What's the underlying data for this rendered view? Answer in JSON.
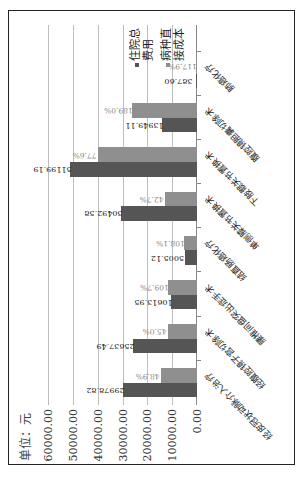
{
  "chart_data": {
    "type": "bar",
    "orientation_in_image": "rotated 90 degrees counter-clockwise",
    "unit_label": "单位：元",
    "ylim": [
      0,
      60000
    ],
    "yticks": [
      "60000.00",
      "50000.00",
      "40000.00",
      "30000.00",
      "20000.00",
      "10000.00",
      "0.00"
    ],
    "grid": true,
    "legend_position": "right",
    "categories": [
      "经皮冠状动脉介入治疗",
      "经腹腔镜子宫切除术",
      "腰椎间盘突出症手术",
      "结直肠癌化疗",
      "单侧膝关节置换术",
      "下肢髋关节置换术",
      "腹腔镜胆囊切除术",
      "肺癌化疗"
    ],
    "series": [
      {
        "name": "住院总费用",
        "color": "#555555",
        "values": [
          29978.82,
          25637.49,
          10613.95,
          5005.12,
          30492.58,
          51199.19,
          13949.11,
          387.6
        ],
        "labels": [
          "29978.82",
          "25637.49",
          "10613.95",
          "5005.12",
          "30492.58",
          "51199.19",
          "13949.11",
          "387.60"
        ]
      },
      {
        "name": "病种直接成本",
        "color": "#8f8f8f",
        "values": [
          14660,
          11537,
          11643,
          5411,
          13020,
          39731,
          26364,
          457
        ],
        "ratio_labels": [
          "48.9%",
          "45.0%",
          "109.7%",
          "108.1%",
          "42.7%",
          "77.6%",
          "189.0%",
          "117.9%"
        ]
      }
    ]
  },
  "legend": {
    "items": [
      {
        "label": "住院总费用",
        "color": "#555555"
      },
      {
        "label": "病种直接成本",
        "color": "#8f8f8f"
      }
    ]
  }
}
